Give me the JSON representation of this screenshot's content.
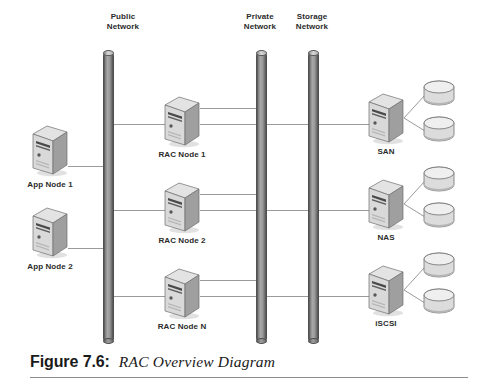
{
  "figure": {
    "number_label": "Figure 7.6:",
    "title": "RAC Overview Diagram"
  },
  "networks": [
    {
      "id": "public",
      "name_line1": "Public",
      "name_line2": "Network"
    },
    {
      "id": "private",
      "name_line1": "Private",
      "name_line2": "Network"
    },
    {
      "id": "storage",
      "name_line1": "Storage",
      "name_line2": "Network"
    }
  ],
  "app_nodes": [
    {
      "label": "App Node 1"
    },
    {
      "label": "App Node 2"
    }
  ],
  "rac_nodes": [
    {
      "label": "RAC Node 1"
    },
    {
      "label": "RAC Node 2"
    },
    {
      "label": "RAC Node N"
    }
  ],
  "storage_nodes": [
    {
      "label": "SAN",
      "disks": 2
    },
    {
      "label": "NAS",
      "disks": 2
    },
    {
      "label": "iSCSI",
      "disks": 2
    }
  ],
  "colors": {
    "background": "#ffffff",
    "text": "#2b2b2b",
    "wire": "#9b9b9b",
    "bus_dark": "#3f3f3f",
    "bus_light": "#a8a8a8",
    "server_face": "#d8d8d8",
    "server_side": "#9a9a9a",
    "rule": "#8c8c8c"
  }
}
